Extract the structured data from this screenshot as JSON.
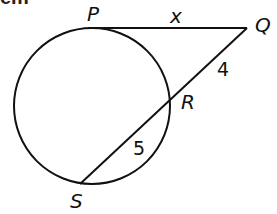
{
  "header": {
    "fragment": "em"
  },
  "figure": {
    "type": "circle-tangent-secant",
    "circle": {
      "cx": 92,
      "cy": 106,
      "r": 78
    },
    "points": {
      "P": {
        "label": "P",
        "x": 88,
        "y": 28
      },
      "Q": {
        "label": "Q",
        "x": 247,
        "y": 28
      },
      "R": {
        "label": "R",
        "x": 173,
        "y": 92
      },
      "S": {
        "label": "S",
        "x": 80,
        "y": 184
      }
    },
    "segments": {
      "PQ": {
        "label": "x"
      },
      "QR": {
        "label": "4"
      },
      "RS": {
        "label": "5"
      }
    },
    "stroke_color": "#111111"
  }
}
